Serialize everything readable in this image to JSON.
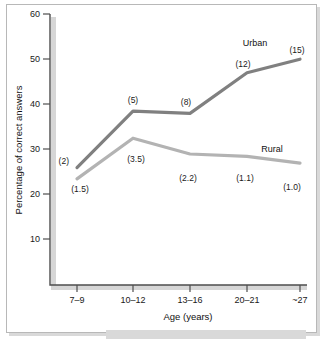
{
  "chart_data": {
    "type": "line",
    "title": "",
    "xlabel": "Age (years)",
    "ylabel": "Percentage of correct answers",
    "categories": [
      "7–9",
      "10–12",
      "13–16",
      "20–21",
      "~27"
    ],
    "ylim": [
      0,
      60
    ],
    "yticks": [
      10,
      20,
      30,
      40,
      50,
      60
    ],
    "grid": false,
    "legend_position": "inline-end-of-line",
    "series": [
      {
        "name": "Urban",
        "color": "#808080",
        "values": [
          26,
          38.5,
          38,
          47,
          50
        ],
        "point_labels": [
          "(2)",
          "(5)",
          "(8)",
          "(12)",
          "(15)"
        ]
      },
      {
        "name": "Rural",
        "color": "#b3b3b3",
        "values": [
          23.5,
          32.5,
          29,
          28.5,
          27
        ],
        "point_labels": [
          "(1.5)",
          "(3.5)",
          "(2.2)",
          "(1.1)",
          "(1.0)"
        ]
      }
    ]
  },
  "axes": {
    "y_tick_labels": [
      "60",
      "50",
      "40",
      "30",
      "20",
      "10"
    ],
    "x_tick_labels": [
      "7–9",
      "10–12",
      "13–16",
      "20–21",
      "~27"
    ],
    "y_title": "Percentage of correct answers",
    "x_title": "Age (years)"
  },
  "annotations": {
    "urban_label": "Urban",
    "rural_label": "Rural",
    "urban_points": [
      "(2)",
      "(5)",
      "(8)",
      "(12)",
      "(15)"
    ],
    "rural_points": [
      "(1.5)",
      "(3.5)",
      "(2.2)",
      "(1.1)",
      "(1.0)"
    ]
  },
  "colors": {
    "urban_line": "#808080",
    "rural_line": "#b3b3b3",
    "axis": "#4d4d4d",
    "shadow": "#d9d9d9",
    "frame_border": "#b8b8b8",
    "background": "#ffffff"
  }
}
